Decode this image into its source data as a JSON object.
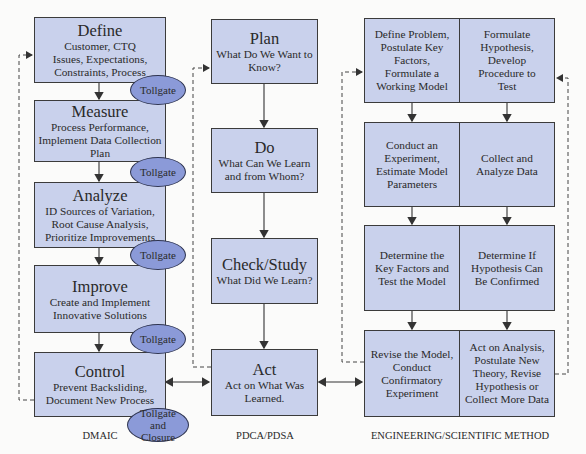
{
  "dmaic": {
    "label": "DMAIC",
    "steps": [
      {
        "title": "Define",
        "desc": [
          "Customer, CTQ",
          "Issues, Expectations,",
          "Constraints, Process"
        ]
      },
      {
        "title": "Measure",
        "desc": [
          "Process Performance,",
          "Implement Data Collection",
          "Plan"
        ]
      },
      {
        "title": "Analyze",
        "desc": [
          "ID Sources of Variation,",
          "Root Cause Analysis,",
          "Prioritize Improvements"
        ]
      },
      {
        "title": "Improve",
        "desc": [
          "Create and Implement",
          "Innovative Solutions"
        ]
      },
      {
        "title": "Control",
        "desc": [
          "Prevent Backsliding,",
          "Document New Process"
        ]
      }
    ],
    "tollgates": [
      "Tollgate",
      "Tollgate",
      "Tollgate",
      "Tollgate",
      "Tollgate and Closure"
    ]
  },
  "pdca": {
    "label": "PDCA/PDSA",
    "steps": [
      {
        "title": "Plan",
        "desc": [
          "What Do We Want to",
          "Know?"
        ]
      },
      {
        "title": "Do",
        "desc": [
          "What Can We Learn",
          "and from Whom?"
        ]
      },
      {
        "title": "Check/Study",
        "desc": [
          "What Did We Learn?"
        ]
      },
      {
        "title": "Act",
        "desc": [
          "Act on What Was",
          "Learned."
        ]
      }
    ]
  },
  "engineering": {
    "label": "ENGINEERING/SCIENTIFIC METHOD",
    "rows": [
      {
        "left": [
          "Define Problem,",
          "Postulate Key",
          "Factors,",
          "Formulate a",
          "Working Model"
        ],
        "right": [
          "Formulate",
          "Hypothesis,",
          "Develop",
          "Procedure to",
          "Test"
        ]
      },
      {
        "left": [
          "Conduct an",
          "Experiment,",
          "Estimate Model",
          "Parameters"
        ],
        "right": [
          "Collect and",
          "Analyze Data"
        ]
      },
      {
        "left": [
          "Determine the",
          "Key Factors and",
          "Test the Model"
        ],
        "right": [
          "Determine If",
          "Hypothesis Can",
          "Be Confirmed"
        ]
      },
      {
        "left": [
          "Revise the Model,",
          "Conduct",
          "Confirmatory",
          "Experiment"
        ],
        "right": [
          "Act on Analysis,",
          "Postulate New",
          "Theory, Revise",
          "Hypothesis or",
          "Collect More Data"
        ]
      }
    ]
  },
  "colors": {
    "box_fill": "#c9d1ec",
    "oval_fill": "#8b9ad8",
    "line": "#3b3b3b"
  }
}
